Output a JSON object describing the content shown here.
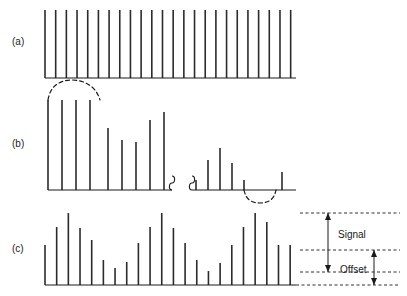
{
  "figure": {
    "title": "",
    "panels": [
      {
        "id": "a",
        "label": "(a)"
      },
      {
        "id": "b",
        "label": "(b)"
      },
      {
        "id": "c",
        "label": "(c)"
      }
    ],
    "annotations": {
      "signal_label": "Signal",
      "offset_label": "Offset"
    },
    "colors": {
      "line": "#1a1a1a",
      "bar": "#2b2b2b",
      "dashed": "#1a1a1a",
      "background": "#ffffff"
    }
  },
  "chart_data": [
    {
      "type": "bar",
      "id": "a",
      "title": "(a)",
      "xlabel": "",
      "ylabel": "",
      "grid": false,
      "legend": "none",
      "axis": {
        "x0": 45,
        "x1": 296,
        "baseline_y": 78
      },
      "ylim": [
        0,
        72
      ],
      "categories": [
        "1",
        "2",
        "3",
        "4",
        "5",
        "6",
        "7",
        "8",
        "9",
        "10",
        "11",
        "12",
        "13",
        "14",
        "15",
        "16",
        "17",
        "18",
        "19",
        "20",
        "21",
        "22",
        "23",
        "24"
      ],
      "values": [
        70,
        70,
        70,
        70,
        70,
        70,
        70,
        70,
        70,
        70,
        70,
        70,
        70,
        70,
        70,
        70,
        70,
        70,
        70,
        70,
        70,
        70,
        70,
        70
      ]
    },
    {
      "type": "bar",
      "id": "b",
      "title": "(b)",
      "xlabel": "",
      "ylabel": "",
      "grid": false,
      "legend": "none",
      "axis": {
        "x0": 48,
        "x1": 296,
        "baseline_y": 190
      },
      "ylim": [
        -12,
        100
      ],
      "break_symbol": true,
      "envelope_top": "dashed arc over first bar group",
      "envelope_bottom": "dashed arc below baseline near right",
      "categories": [
        "1",
        "2",
        "3",
        "4",
        "5",
        "6",
        "7",
        "8",
        "9",
        "10",
        "11",
        "12",
        "13",
        "14",
        "15",
        "16",
        "17",
        "18"
      ],
      "values": [
        90,
        90,
        90,
        90,
        62,
        50,
        48,
        70,
        78,
        0,
        10,
        30,
        42,
        27,
        10,
        0,
        0,
        18
      ],
      "x": [
        48,
        62,
        76,
        90,
        108,
        122,
        136,
        150,
        164,
        176,
        196,
        208,
        220,
        232,
        244,
        256,
        268,
        282
      ]
    },
    {
      "type": "bar",
      "id": "c",
      "title": "(c)",
      "xlabel": "",
      "ylabel": "",
      "grid": false,
      "legend": "none",
      "axis": {
        "x0": 45,
        "x1": 296,
        "baseline_y": 285
      },
      "ylim": [
        0,
        74
      ],
      "offset_level": 26,
      "signal_top": 72,
      "categories": [
        "1",
        "2",
        "3",
        "4",
        "5",
        "6",
        "7",
        "8",
        "9",
        "10",
        "11",
        "12",
        "13",
        "14",
        "15",
        "16",
        "17",
        "18",
        "19",
        "20",
        "21",
        "22"
      ],
      "values": [
        40,
        58,
        72,
        57,
        45,
        25,
        17,
        23,
        42,
        58,
        72,
        57,
        42,
        25,
        14,
        22,
        40,
        58,
        72,
        63,
        40,
        40
      ],
      "annotations": [
        {
          "name": "Signal",
          "from": 26,
          "to": 72
        },
        {
          "name": "Offset",
          "from": 0,
          "to": 26
        }
      ]
    }
  ]
}
